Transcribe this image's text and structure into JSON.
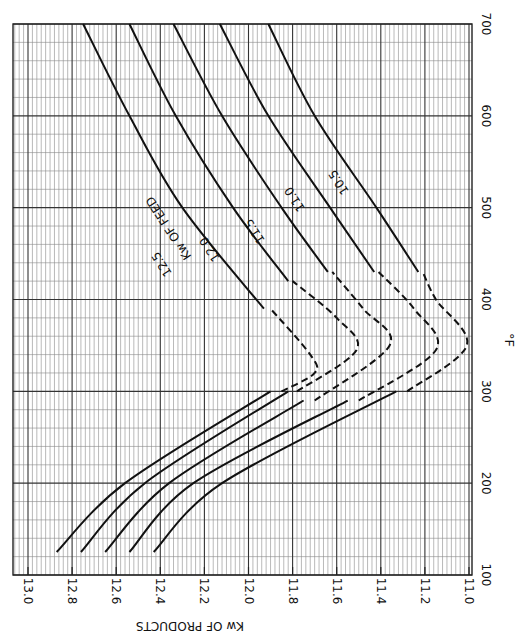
{
  "chart_data": {
    "type": "line",
    "title": "",
    "orientation_note": "figure rotated 90 degrees; temperature axis runs vertically on the right",
    "xlabel": "°F",
    "ylabel": "Kw OF PRODUCTS",
    "xlim": [
      100,
      700
    ],
    "ylim": [
      11.0,
      13.0
    ],
    "x_ticks": [
      "100",
      "200",
      "300",
      "400",
      "500",
      "600",
      "700"
    ],
    "y_ticks": [
      "13.0",
      "12.8",
      "12.6",
      "12.4",
      "12.2",
      "12.0",
      "11.8",
      "11.6",
      "11.4",
      "11.2",
      "11.0"
    ],
    "grid": true,
    "legend_title": "Kw OF FEED",
    "series": [
      {
        "name": "12.5",
        "solid_lower": [
          [
            125,
            12.87
          ],
          [
            200,
            12.56
          ],
          [
            300,
            11.9
          ]
        ],
        "dashed": [
          [
            300,
            11.85
          ],
          [
            320,
            11.7
          ],
          [
            340,
            11.72
          ],
          [
            390,
            11.9
          ]
        ],
        "solid_upper": [
          [
            390,
            11.93
          ],
          [
            500,
            12.3
          ],
          [
            600,
            12.54
          ],
          [
            700,
            12.75
          ]
        ]
      },
      {
        "name": "12.0",
        "solid_lower": [
          [
            125,
            12.76
          ],
          [
            200,
            12.47
          ],
          [
            300,
            11.82
          ]
        ],
        "dashed": [
          [
            300,
            11.78
          ],
          [
            345,
            11.51
          ],
          [
            380,
            11.6
          ],
          [
            420,
            11.8
          ]
        ],
        "solid_upper": [
          [
            420,
            11.82
          ],
          [
            500,
            12.07
          ],
          [
            600,
            12.33
          ],
          [
            700,
            12.54
          ]
        ]
      },
      {
        "name": "11.5",
        "solid_lower": [
          [
            125,
            12.65
          ],
          [
            200,
            12.36
          ],
          [
            290,
            11.75
          ]
        ],
        "dashed": [
          [
            290,
            11.7
          ],
          [
            350,
            11.36
          ],
          [
            390,
            11.48
          ],
          [
            430,
            11.62
          ]
        ],
        "solid_upper": [
          [
            430,
            11.64
          ],
          [
            500,
            11.85
          ],
          [
            600,
            12.12
          ],
          [
            700,
            12.34
          ]
        ]
      },
      {
        "name": "11.0",
        "solid_lower": [
          [
            125,
            12.54
          ],
          [
            200,
            12.25
          ],
          [
            290,
            11.55
          ]
        ],
        "dashed": [
          [
            290,
            11.5
          ],
          [
            345,
            11.15
          ],
          [
            390,
            11.25
          ],
          [
            430,
            11.41
          ]
        ],
        "solid_upper": [
          [
            430,
            11.43
          ],
          [
            500,
            11.63
          ],
          [
            600,
            11.91
          ],
          [
            700,
            12.13
          ]
        ]
      },
      {
        "name": "10.5",
        "solid_lower": [
          [
            125,
            12.43
          ],
          [
            200,
            12.12
          ],
          [
            300,
            11.33
          ]
        ],
        "dashed": [
          [
            300,
            11.28
          ],
          [
            350,
            11.01
          ],
          [
            400,
            11.15
          ],
          [
            430,
            11.21
          ]
        ],
        "solid_upper": [
          [
            430,
            11.23
          ],
          [
            500,
            11.42
          ],
          [
            600,
            11.7
          ],
          [
            700,
            11.91
          ]
        ]
      }
    ],
    "curve_labels": [
      "12.5",
      "12.0",
      "11.5",
      "11.0",
      "10.5"
    ]
  }
}
